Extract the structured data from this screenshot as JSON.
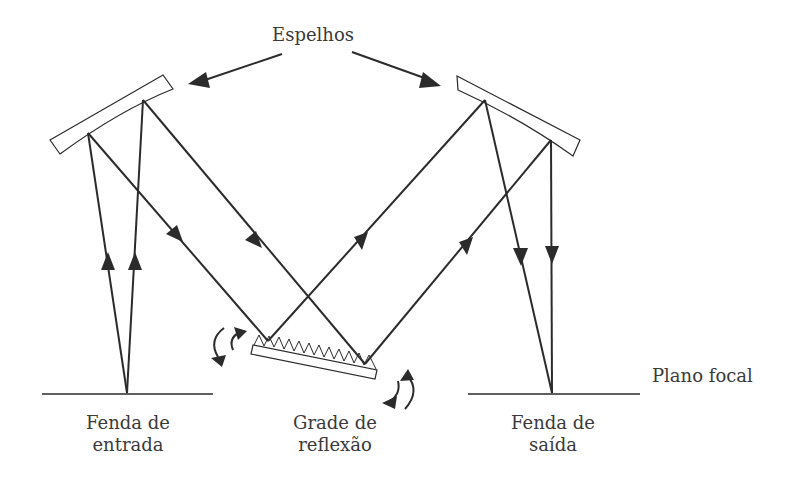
{
  "labels": {
    "mirrors": "Espelhos",
    "entrance_slit_line1": "Fenda de",
    "entrance_slit_line2": "entrada",
    "grating_line1": "Grade de",
    "grating_line2": "reflexão",
    "exit_slit_line1": "Fenda de",
    "exit_slit_line2": "saída",
    "focal_plane": "Plano focal"
  },
  "colors": {
    "line": "#2b2b2b",
    "text": "#3a3a3a",
    "background": "#ffffff"
  }
}
